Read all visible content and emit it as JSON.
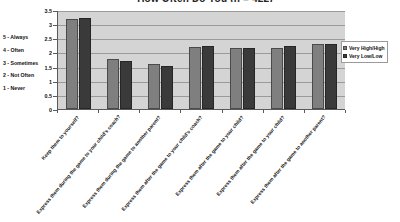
{
  "chart_data": {
    "type": "bar",
    "title": "How Often Do You (n = 422)",
    "xlabel": "",
    "ylabel": "",
    "ylim": [
      0,
      3.5
    ],
    "yticks": [
      "0",
      "0.5",
      "1",
      "1.5",
      "2",
      "2.5",
      "3",
      "3.5"
    ],
    "grid": true,
    "legend_position": "right",
    "categories": [
      "Keep them to yourself?",
      "Express them during the game to your child's coach?",
      "Express them during the game to another parent?",
      "Express them after the game to your child's coach?",
      "Express them after the game to your child?",
      "Express them after the game to your child?",
      "Express them after the game to another parent?"
    ],
    "series": [
      {
        "name": "Very High/High",
        "color": "#7f7f7f",
        "values": [
          3.17,
          1.78,
          1.58,
          2.18,
          2.15,
          2.15,
          2.31
        ]
      },
      {
        "name": "Very Low/Low",
        "color": "#3a3a3a",
        "values": [
          3.22,
          1.68,
          1.51,
          2.23,
          2.17,
          2.23,
          2.3
        ]
      }
    ],
    "scale_legend": [
      "5 - Always",
      "4 - Often",
      "3 - Sometimes",
      "2 - Not Often",
      "1 - Never"
    ]
  }
}
